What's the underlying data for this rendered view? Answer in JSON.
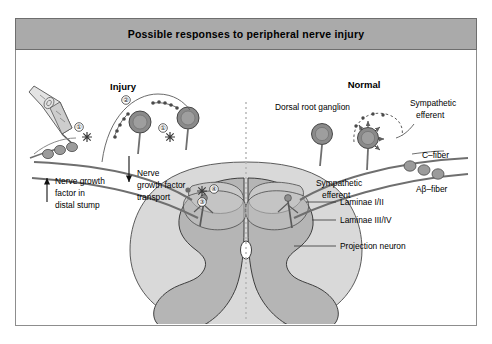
{
  "header": {
    "title": "Possible responses to peripheral nerve injury"
  },
  "sections": {
    "injury_heading": "Injury",
    "normal_heading": "Normal"
  },
  "labels": {
    "nerve_growth_factor_distal": [
      "Nerve growth",
      "factor in",
      "distal stump"
    ],
    "nerve_growth_factor_transport": [
      "Nerve",
      "growth factor",
      "transport"
    ],
    "dorsal_root_ganglion": "Dorsal root ganglion",
    "sympathetic_efferent_top": [
      "Sympathetic",
      "efferent"
    ],
    "sympathetic_efferent_mid": [
      "Sympathetic",
      "efferent"
    ],
    "c_fiber": "C–fiber",
    "ab_fiber": "Aβ–fiber",
    "laminae_1_2": "Laminae I/II",
    "laminae_3_4": "Laminae III/IV",
    "projection_neuron": "Projection neuron"
  },
  "markers": {
    "one_left": "①",
    "two": "②",
    "one_right": "①",
    "three": "③",
    "four": "④"
  },
  "colors": {
    "header_band": "#aaaaaa",
    "frame_border": "#8d8d8d",
    "white_matter": "#d8d8d8",
    "gray_matter": "#b4b4b4",
    "lamina_band": "#c6c6c6",
    "neuron_body": "#8a8a8a",
    "fiber_line": "#6d6d6d",
    "dashed_midline": "#b0b0b0",
    "text": "#000000"
  }
}
